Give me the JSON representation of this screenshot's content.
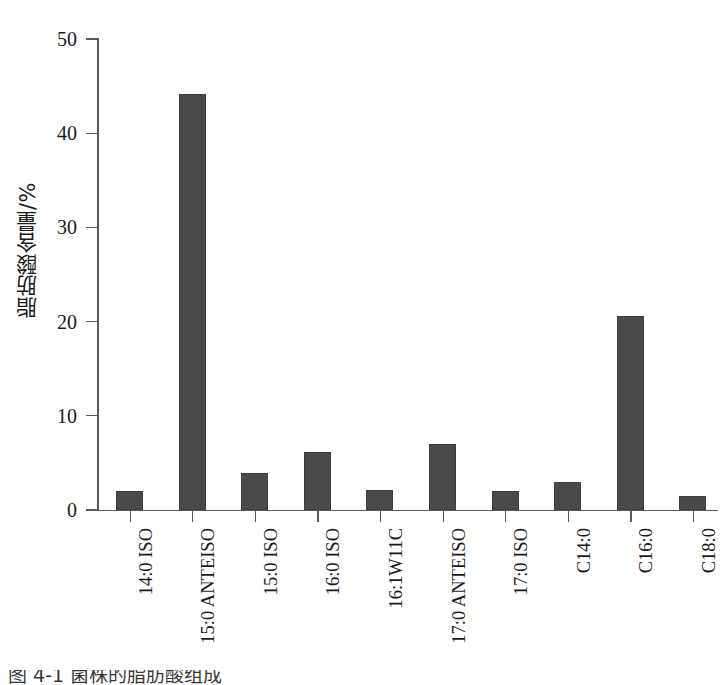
{
  "chart_data": {
    "type": "bar",
    "title": "",
    "xlabel": "",
    "ylabel": "脂肪酸含量/%",
    "ylim": [
      0,
      50
    ],
    "yticks": [
      0,
      10,
      20,
      30,
      40,
      50
    ],
    "grid": false,
    "legend": null,
    "bar_color": "#4a4a4a",
    "categories": [
      "14:0 ISO",
      "15:0 ANTEISO",
      "15:0 ISO",
      "16:0 ISO",
      "16:1W11C",
      "17:0 ANTEISO",
      "17:0 ISO",
      "C14:0",
      "C16:0",
      "C18:0"
    ],
    "values": [
      2.0,
      44.2,
      3.9,
      6.2,
      2.1,
      7.0,
      2.0,
      3.0,
      20.6,
      1.5
    ]
  },
  "axis": {
    "y_tick_labels": [
      "0",
      "10",
      "20",
      "30",
      "40",
      "50"
    ],
    "y_axis_title": "脂肪酸含量/%"
  },
  "caption": {
    "text": "图 4-1   菌株的脂肪酸组成"
  }
}
